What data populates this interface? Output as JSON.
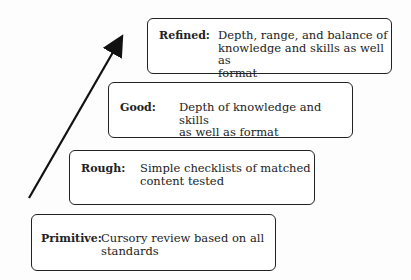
{
  "diagram": {
    "type": "staircase-progression",
    "arrow": {
      "direction": "up-right",
      "meaning": "increasing quality"
    },
    "levels": [
      {
        "label": "Refined:",
        "description": "Depth, range, and balance of knowledge and skills as well as format",
        "lines": [
          "Depth, range, and balance of",
          "knowledge and skills as well as",
          "format"
        ]
      },
      {
        "label": "Good:",
        "description": "Depth of knowledge and skills as well as format",
        "lines": [
          "Depth of knowledge and skills",
          "as well as format"
        ]
      },
      {
        "label": "Rough:",
        "description": "Simple checklists of matched content tested",
        "lines": [
          "Simple checklists of matched",
          "content tested"
        ]
      },
      {
        "label": "Primitive:",
        "description": "Cursory review based on all standards",
        "lines": [
          "Cursory review based on  all",
          "standards"
        ]
      }
    ]
  }
}
